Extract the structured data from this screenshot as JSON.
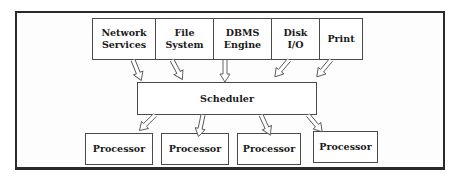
{
  "diagram": {
    "services": [
      {
        "id": "network",
        "line1": "Network",
        "line2": "Services"
      },
      {
        "id": "file",
        "line1": "File",
        "line2": "System"
      },
      {
        "id": "dbms",
        "line1": "DBMS",
        "line2": "Engine"
      },
      {
        "id": "disk",
        "line1": "Disk",
        "line2": "I/O"
      },
      {
        "id": "print",
        "line1": "Print",
        "line2": ""
      }
    ],
    "scheduler": {
      "label": "Scheduler"
    },
    "processors": [
      {
        "label": "Processor"
      },
      {
        "label": "Processor"
      },
      {
        "label": "Processor"
      },
      {
        "label": "Processor"
      }
    ],
    "colors": {
      "border": "#4a4a4a",
      "frame": "#2a2a2a",
      "background": "#ffffff",
      "text": "#1a1a1a"
    }
  }
}
